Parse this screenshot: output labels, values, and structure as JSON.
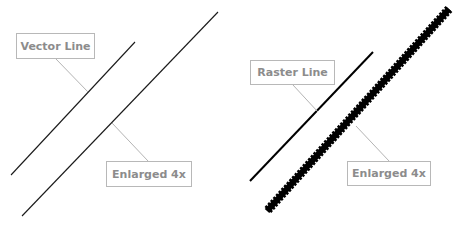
{
  "figure": {
    "left_panel": {
      "label": "Vector Line",
      "enlarged_label": "Enlarged 4x"
    },
    "right_panel": {
      "label": "Raster Line",
      "enlarged_label": "Enlarged 4x"
    },
    "colors": {
      "line": "#1a1a1a",
      "leader": "#b4b4b4",
      "label_text": "#8c8c8c",
      "label_border": "#b8b8b8"
    }
  }
}
